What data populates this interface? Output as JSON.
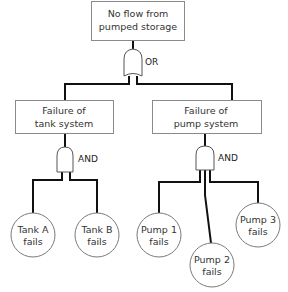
{
  "diagram": {
    "type": "fault-tree",
    "top_event": {
      "line1": "No flow from",
      "line2": "pumped storage"
    },
    "top_gate": {
      "type": "OR",
      "label": "OR"
    },
    "intermediate_events": [
      {
        "line1": "Failure of",
        "line2": "tank system",
        "gate": {
          "type": "AND",
          "label": "AND"
        }
      },
      {
        "line1": "Failure of",
        "line2": "pump system",
        "gate": {
          "type": "AND",
          "label": "AND"
        }
      }
    ],
    "basic_events": [
      {
        "line1": "Tank A",
        "line2": "fails",
        "parent": "tank system"
      },
      {
        "line1": "Tank B",
        "line2": "fails",
        "parent": "tank system"
      },
      {
        "line1": "Pump 1",
        "line2": "fails",
        "parent": "pump system"
      },
      {
        "line1": "Pump 2",
        "line2": "fails",
        "parent": "pump system"
      },
      {
        "line1": "Pump 3",
        "line2": "fails",
        "parent": "pump system"
      }
    ]
  }
}
